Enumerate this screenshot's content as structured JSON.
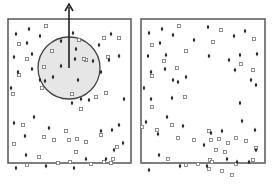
{
  "figure": {
    "width": 275,
    "height": 186,
    "colors": {
      "frame": "#555555",
      "diamond": "#222222",
      "square_stroke": "#777777",
      "square_fill": "#ffffff",
      "circle_fill": "#e6e6e6",
      "circle_stroke": "#444444",
      "arrow": "#222222"
    },
    "panels": [
      {
        "id": "left",
        "frame": {
          "x": 8,
          "y": 19,
          "w": 123,
          "h": 144
        },
        "selection_circle": {
          "cx": 69,
          "cy": 68,
          "r": 31
        },
        "arrow": {
          "x1": 69,
          "y1": 68,
          "x2": 69,
          "y2": 4
        },
        "diamonds": [
          [
            16,
            34
          ],
          [
            29,
            29
          ],
          [
            40,
            36
          ],
          [
            61,
            41
          ],
          [
            27,
            43
          ],
          [
            14,
            57
          ],
          [
            32,
            54
          ],
          [
            32,
            69
          ],
          [
            11,
            88
          ],
          [
            18,
            72
          ],
          [
            40,
            80
          ],
          [
            53,
            77
          ],
          [
            45,
            81
          ],
          [
            61,
            66
          ],
          [
            78,
            80
          ],
          [
            75,
            59
          ],
          [
            93,
            61
          ],
          [
            101,
            72
          ],
          [
            109,
            60
          ],
          [
            119,
            56
          ],
          [
            111,
            34
          ],
          [
            99,
            45
          ],
          [
            73,
            33
          ],
          [
            76,
            49
          ],
          [
            81,
            99
          ],
          [
            89,
            100
          ],
          [
            34,
            117
          ],
          [
            14,
            123
          ],
          [
            25,
            136
          ],
          [
            49,
            128
          ],
          [
            72,
            103
          ],
          [
            26,
            155
          ],
          [
            16,
            168
          ],
          [
            46,
            166
          ],
          [
            74,
            168
          ],
          [
            86,
            159
          ],
          [
            106,
            159
          ],
          [
            114,
            150
          ],
          [
            112,
            130
          ],
          [
            123,
            143
          ],
          [
            119,
            125
          ],
          [
            101,
            131
          ],
          [
            124,
            99
          ]
        ],
        "squares": [
          [
            46,
            26
          ],
          [
            19,
            44
          ],
          [
            52,
            51
          ],
          [
            27,
            59
          ],
          [
            19,
            75
          ],
          [
            44,
            67
          ],
          [
            42,
            88
          ],
          [
            86,
            60
          ],
          [
            108,
            57
          ],
          [
            119,
            38
          ],
          [
            104,
            38
          ],
          [
            79,
            40
          ],
          [
            84,
            59
          ],
          [
            96,
            97
          ],
          [
            106,
            93
          ],
          [
            72,
            94
          ],
          [
            81,
            109
          ],
          [
            13,
            94
          ],
          [
            23,
            125
          ],
          [
            44,
            137
          ],
          [
            14,
            144
          ],
          [
            54,
            140
          ],
          [
            69,
            140
          ],
          [
            77,
            139
          ],
          [
            86,
            142
          ],
          [
            101,
            135
          ],
          [
            117,
            147
          ],
          [
            113,
            159
          ],
          [
            76,
            152
          ],
          [
            70,
            162
          ],
          [
            27,
            165
          ],
          [
            39,
            157
          ],
          [
            58,
            163
          ],
          [
            91,
            164
          ],
          [
            104,
            162
          ],
          [
            111,
            163
          ],
          [
            66,
            131
          ]
        ]
      },
      {
        "id": "right",
        "frame": {
          "x": 141,
          "y": 19,
          "w": 124,
          "h": 144
        },
        "diamonds": [
          [
            149,
            33
          ],
          [
            162,
            29
          ],
          [
            173,
            35
          ],
          [
            194,
            40
          ],
          [
            160,
            43
          ],
          [
            148,
            56
          ],
          [
            166,
            55
          ],
          [
            165,
            69
          ],
          [
            144,
            88
          ],
          [
            151,
            72
          ],
          [
            173,
            80
          ],
          [
            186,
            77
          ],
          [
            178,
            82
          ],
          [
            208,
            27
          ],
          [
            234,
            36
          ],
          [
            245,
            31
          ],
          [
            257,
            54
          ],
          [
            240,
            55
          ],
          [
            229,
            60
          ],
          [
            235,
            70
          ],
          [
            256,
            85
          ],
          [
            209,
            56
          ],
          [
            251,
            80
          ],
          [
            151,
            99
          ],
          [
            172,
            98
          ],
          [
            167,
            117
          ],
          [
            146,
            122
          ],
          [
            158,
            134
          ],
          [
            183,
            126
          ],
          [
            159,
            155
          ],
          [
            149,
            170
          ],
          [
            180,
            166
          ],
          [
            207,
            166
          ],
          [
            227,
            159
          ],
          [
            249,
            162
          ],
          [
            256,
            150
          ],
          [
            255,
            130
          ],
          [
            242,
            121
          ],
          [
            240,
            103
          ],
          [
            222,
            131
          ],
          [
            211,
            133
          ],
          [
            204,
            145
          ],
          [
            237,
            162
          ]
        ],
        "squares": [
          [
            179,
            26
          ],
          [
            152,
            45
          ],
          [
            186,
            51
          ],
          [
            164,
            61
          ],
          [
            152,
            76
          ],
          [
            177,
            68
          ],
          [
            221,
            30
          ],
          [
            254,
            39
          ],
          [
            213,
            42
          ],
          [
            241,
            64
          ],
          [
            253,
            70
          ],
          [
            185,
            97
          ],
          [
            152,
            107
          ],
          [
            142,
            127
          ],
          [
            157,
            130
          ],
          [
            172,
            125
          ],
          [
            178,
            138
          ],
          [
            194,
            140
          ],
          [
            209,
            131
          ],
          [
            211,
            140
          ],
          [
            219,
            139
          ],
          [
            228,
            143
          ],
          [
            236,
            138
          ],
          [
            246,
            141
          ],
          [
            256,
            148
          ],
          [
            216,
            150
          ],
          [
            225,
            152
          ],
          [
            253,
            160
          ],
          [
            236,
            164
          ],
          [
            232,
            175
          ],
          [
            222,
            171
          ],
          [
            209,
            169
          ],
          [
            198,
            164
          ],
          [
            186,
            165
          ],
          [
            168,
            159
          ],
          [
            210,
            160
          ],
          [
            212,
            162
          ]
        ]
      }
    ]
  }
}
